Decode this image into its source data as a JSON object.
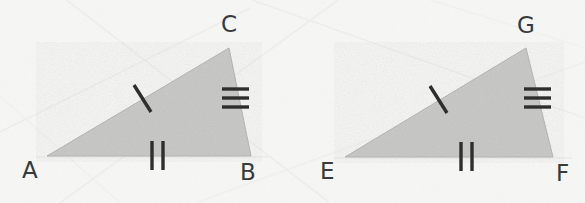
{
  "figure": {
    "background_color": "#fbfbfa",
    "triangle_fill_color": "#c9c9c7",
    "triangle_stroke_color": "#b6b6b6",
    "tick_color": "#2e2e2e",
    "label_color": "#3a3a3a"
  },
  "triangles": [
    {
      "name": "triangle-abc",
      "vertices": [
        {
          "label": "A",
          "x": 47,
          "y": 156,
          "label_x": 22,
          "label_y": 178
        },
        {
          "label": "B",
          "x": 251,
          "y": 156,
          "label_x": 240,
          "label_y": 180
        },
        {
          "label": "C",
          "x": 229,
          "y": 48,
          "label_x": 222,
          "label_y": 32
        }
      ],
      "sides": [
        {
          "name": "side-ac",
          "from": "A",
          "to": "C",
          "tick_count": 1,
          "tick_style": "slash"
        },
        {
          "name": "side-ab",
          "from": "A",
          "to": "B",
          "tick_count": 2,
          "tick_style": "vertical"
        },
        {
          "name": "side-bc",
          "from": "B",
          "to": "C",
          "tick_count": 3,
          "tick_style": "horizontal"
        }
      ]
    },
    {
      "name": "triangle-efg",
      "vertices": [
        {
          "label": "E",
          "x": 345,
          "y": 157,
          "label_x": 320,
          "label_y": 179
        },
        {
          "label": "F",
          "x": 553,
          "y": 157,
          "label_x": 556,
          "label_y": 181
        },
        {
          "label": "G",
          "x": 526,
          "y": 48,
          "label_x": 518,
          "label_y": 33
        }
      ],
      "sides": [
        {
          "name": "side-eg",
          "from": "E",
          "to": "G",
          "tick_count": 1,
          "tick_style": "slash"
        },
        {
          "name": "side-ef",
          "from": "E",
          "to": "F",
          "tick_count": 2,
          "tick_style": "vertical"
        },
        {
          "name": "side-fg",
          "from": "F",
          "to": "G",
          "tick_count": 3,
          "tick_style": "horizontal"
        }
      ]
    }
  ],
  "labels": {
    "a": "A",
    "b": "B",
    "c": "C",
    "e": "E",
    "f": "F",
    "g": "G"
  }
}
